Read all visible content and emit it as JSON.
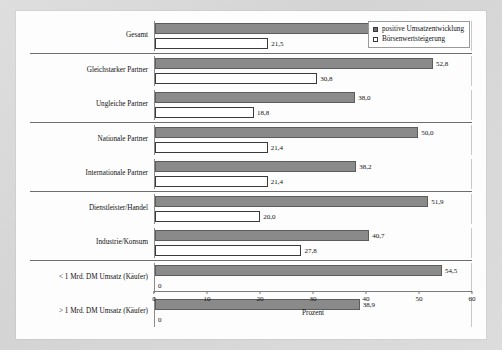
{
  "chart_data": {
    "type": "bar",
    "orientation": "horizontal",
    "title": "",
    "xlabel": "Prozent",
    "ylabel": "",
    "xlim": [
      0,
      60
    ],
    "xticks": [
      0,
      10,
      20,
      30,
      40,
      50,
      60
    ],
    "grid": false,
    "legend_position": "top-right",
    "categories": [
      "Gesamt",
      "Gleichstarker Partner",
      "Ungleiche Partner",
      "Nationale Partner",
      "Internationale Partner",
      "Dienstleister/Handel",
      "Industrie/Konsum",
      "< 1 Mrd. DM Umsatz (Käufer)",
      "> 1 Mrd. DM Umsatz (Käufer)"
    ],
    "series": [
      {
        "name": "positive Umsatzentwicklung",
        "color": "#8a8a8a",
        "values": [
          44.0,
          52.8,
          38.0,
          50.0,
          38.2,
          51.9,
          40.7,
          54.5,
          38.9
        ],
        "labels": [
          "44,0",
          "52,8",
          "38,0",
          "50,0",
          "38,2",
          "51,9",
          "40,7",
          "54,5",
          "38,9"
        ]
      },
      {
        "name": "Börsenwertsteigerung",
        "color": "#ffffff",
        "values": [
          21.5,
          30.8,
          18.8,
          21.4,
          21.4,
          20.0,
          27.8,
          0,
          0
        ],
        "labels": [
          "21,5",
          "30,8",
          "18,8",
          "21,4",
          "21,4",
          "20,0",
          "27,8",
          "0",
          "0"
        ]
      }
    ],
    "groups": [
      {
        "rows": [
          0
        ]
      },
      {
        "rows": [
          1,
          2
        ]
      },
      {
        "rows": [
          3,
          4
        ]
      },
      {
        "rows": [
          5,
          6
        ]
      },
      {
        "rows": [
          7,
          8
        ]
      }
    ]
  },
  "legend": {
    "entries": [
      {
        "label": "positive Umsatzentwicklung",
        "swatch": "filled"
      },
      {
        "label": "Börsenwertsteigerung",
        "swatch": "hollow"
      }
    ]
  },
  "axis": {
    "title": "Prozent",
    "ticks": [
      "0",
      "10",
      "20",
      "30",
      "40",
      "50",
      "60"
    ]
  }
}
